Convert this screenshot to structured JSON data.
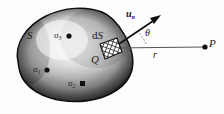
{
  "figure": {
    "name": "gauss-law-closed-surface-diagram",
    "background_color": "#fdfdfd",
    "ink_color": "#1a1a1a"
  },
  "labels": {
    "surface": "S",
    "surface_element": "dS",
    "surface_element_prefix": "d",
    "surface_element_italic": "S",
    "element_point": "Q",
    "field_point": "P",
    "distance": "r",
    "angle": "θ",
    "normal_vector": "u",
    "normal_vector_subscript": "n",
    "charge_1": "σ",
    "charge_1_subscript": "1",
    "charge_2": "σ",
    "charge_2_subscript": "2",
    "charge_3": "σ",
    "charge_3_subscript": "3"
  },
  "geometry": {
    "blob_fill_light": "#f2f2f2",
    "blob_fill_mid": "#b9b9b9",
    "blob_fill_dark": "#4a4a4a",
    "blob_outline": "#111111",
    "patch_fill": "#ffffff",
    "patch_hatch": "#1b1b1b",
    "arrow_color": "#0d0d0d",
    "ray_color": "#555555",
    "charge_dot_color": "#101010",
    "point_p_x": 205,
    "point_p_y": 47,
    "point_q_x": 112,
    "point_q_y": 48,
    "arrow_tip_x": 161,
    "arrow_tip_y": 16,
    "angle_degrees_label": "θ"
  }
}
